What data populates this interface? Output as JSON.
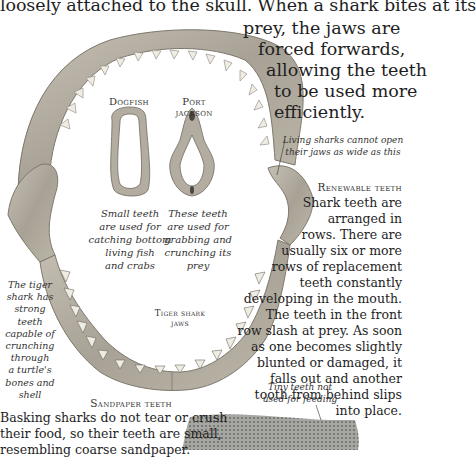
{
  "intro": {
    "line1": "loosely attached to the skull. When a shark bites at its",
    "line2": "prey, the jaws are",
    "line3": "forced forwards,",
    "line4": "allowing the teeth",
    "line5": "to be used more",
    "line6": "efficiently."
  },
  "specimens": {
    "dogfish": {
      "label": "Dogfish",
      "caption": [
        "Small teeth",
        "are used for",
        "catching bottom",
        "living fish",
        "and crabs"
      ]
    },
    "port_jackson": {
      "label": "Port jackson",
      "caption": [
        "These teeth",
        "are used for",
        "grabbing and",
        "crunching its",
        "prey"
      ]
    },
    "tiger_shark": {
      "label_line1": "Tiger shark",
      "label_line2": "jaws",
      "side_caption": [
        "The tiger",
        "shark has",
        "strong teeth",
        "capable of",
        "crunching",
        "through",
        "a turtle's",
        "bones and",
        "shell"
      ]
    }
  },
  "annotations": {
    "living_sharks": [
      "Living sharks cannot open",
      "their jaws as wide as this"
    ],
    "tiny_teeth": [
      "Tiny teeth not",
      "used for feeding"
    ]
  },
  "renewable": {
    "heading": "Renewable teeth",
    "lines": [
      "Shark teeth are",
      "arranged in",
      "rows. There are",
      "usually six or more",
      "rows of replacement",
      "teeth constantly",
      "developing in the mouth.",
      "The teeth in the front",
      "row slash at prey. As soon",
      "as one becomes slightly",
      "blunted or damaged, it",
      "falls out and another",
      "tooth from behind slips",
      "into place."
    ]
  },
  "sandpaper": {
    "heading": "Sandpaper teeth",
    "lines": [
      "Basking sharks do not tear or crush",
      "their food, so their teeth are small,",
      "resembling coarse sandpaper."
    ]
  },
  "colors": {
    "text": "#1e1e1e",
    "jaw_bone": "#b8b2a6",
    "jaw_shadow": "#7d776c",
    "tooth": "#efece4",
    "sandpaper": "#9a9a96"
  }
}
